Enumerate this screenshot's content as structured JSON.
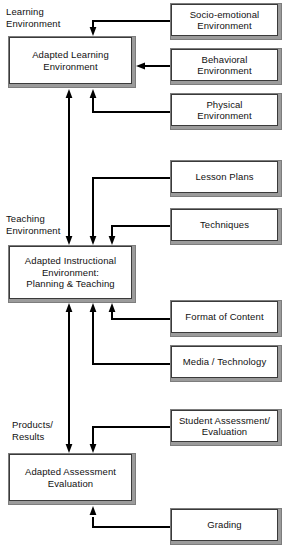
{
  "diagram": {
    "canvas": {
      "width": 286,
      "height": 557,
      "background": "#ffffff"
    },
    "style": {
      "box_face": "#ffffff",
      "box_shadow": "#9b9b9b",
      "line": "#000000",
      "text": "#111111"
    },
    "captions": [
      {
        "id": "cap-learning",
        "text": "Learning\nEnvironment",
        "x": 6,
        "y": 6
      },
      {
        "id": "cap-teaching",
        "text": "Teaching\nEnvironment",
        "x": 6,
        "y": 213
      },
      {
        "id": "cap-products",
        "text": "Products/\nResults",
        "x": 12,
        "y": 419
      }
    ],
    "nodes": [
      {
        "id": "adapted-learning-environment",
        "text": "Adapted Learning\nEnvironment",
        "x": 8,
        "y": 36,
        "w": 128,
        "h": 52,
        "side": "left"
      },
      {
        "id": "socio-emotional-environment",
        "text": "Socio-emotional\nEnvironment",
        "x": 170,
        "y": 3,
        "w": 112,
        "h": 37,
        "side": "right"
      },
      {
        "id": "behavioral-environment",
        "text": "Behavioral\nEnvironment",
        "x": 170,
        "y": 48,
        "w": 112,
        "h": 37,
        "side": "right"
      },
      {
        "id": "physical-environment",
        "text": "Physical\nEnvironment",
        "x": 170,
        "y": 93,
        "w": 112,
        "h": 37,
        "side": "right"
      },
      {
        "id": "lesson-plans",
        "text": "Lesson Plans",
        "x": 170,
        "y": 160,
        "w": 112,
        "h": 37,
        "side": "right"
      },
      {
        "id": "techniques",
        "text": "Techniques",
        "x": 170,
        "y": 208,
        "w": 112,
        "h": 37,
        "side": "right"
      },
      {
        "id": "adapted-instructional-environment",
        "text": "Adapted Instructional\nEnvironment:\nPlanning & Teaching",
        "x": 8,
        "y": 245,
        "w": 128,
        "h": 58,
        "side": "left"
      },
      {
        "id": "format-of-content",
        "text": "Format of Content",
        "x": 170,
        "y": 300,
        "w": 112,
        "h": 37,
        "side": "right"
      },
      {
        "id": "media-technology",
        "text": "Media / Technology",
        "x": 170,
        "y": 345,
        "w": 112,
        "h": 37,
        "side": "right"
      },
      {
        "id": "student-assessment-evaluation",
        "text": "Student Assessment/\nEvaluation",
        "x": 170,
        "y": 409,
        "w": 112,
        "h": 37,
        "side": "right"
      },
      {
        "id": "adapted-assessment-evaluation",
        "text": "Adapted Assessment\nEvaluation",
        "x": 8,
        "y": 453,
        "w": 128,
        "h": 52,
        "side": "left"
      },
      {
        "id": "grading",
        "text": "Grading",
        "x": 170,
        "y": 508,
        "w": 112,
        "h": 37,
        "side": "right"
      }
    ],
    "edges": [
      {
        "id": "edge-socio-to-learning",
        "from": "socio-emotional-environment",
        "to": "adapted-learning-environment",
        "path": "M170,21 L93,21 L93,32",
        "arrow": "down",
        "tip": [
          93,
          34
        ]
      },
      {
        "id": "edge-behavioral-to-learning",
        "from": "behavioral-environment",
        "to": "adapted-learning-environment",
        "path": "M170,66 L142,66",
        "arrow": "left",
        "tip": [
          137,
          66
        ]
      },
      {
        "id": "edge-physical-to-learning",
        "from": "physical-environment",
        "to": "adapted-learning-environment",
        "path": "M170,111 L93,111 L93,97",
        "arrow": "up",
        "tip": [
          93,
          91
        ]
      },
      {
        "id": "edge-instructional-to-learning",
        "from": "adapted-instructional-environment",
        "to": "adapted-learning-environment",
        "path": "M69,241 L69,97",
        "arrow": "up",
        "tip": [
          69,
          91
        ]
      },
      {
        "id": "edge-lesson-plans-to-instructional",
        "from": "lesson-plans",
        "to": "adapted-instructional-environment",
        "path": "M170,178 L93,178 L93,235",
        "arrow": "down",
        "tip": [
          93,
          242
        ]
      },
      {
        "id": "edge-techniques-to-instructional",
        "from": "techniques",
        "to": "adapted-instructional-environment",
        "path": "M170,226 L112,226 L112,235",
        "arrow": "down",
        "tip": [
          112,
          242
        ]
      },
      {
        "id": "edge-format-to-instructional",
        "from": "format-of-content",
        "to": "adapted-instructional-environment",
        "path": "M170,318 L112,318 L112,313",
        "arrow": "up",
        "tip": [
          112,
          306
        ]
      },
      {
        "id": "edge-media-to-instructional",
        "from": "media-technology",
        "to": "adapted-instructional-environment",
        "path": "M170,363 L93,363 L93,313",
        "arrow": "up",
        "tip": [
          93,
          306
        ]
      },
      {
        "id": "edge-assessment-to-instructional",
        "from": "adapted-assessment-evaluation",
        "to": "adapted-instructional-environment",
        "path": "M69,449 L69,313",
        "arrow": "up",
        "tip": [
          69,
          306
        ]
      },
      {
        "id": "edge-student-assessment-to-assessment",
        "from": "student-assessment-evaluation",
        "to": "adapted-assessment-evaluation",
        "path": "M170,427 L93,427 L93,443",
        "arrow": "down",
        "tip": [
          93,
          450
        ]
      },
      {
        "id": "edge-grading-to-assessment",
        "from": "grading",
        "to": "adapted-assessment-evaluation",
        "path": "M170,526 L93,526 L93,518",
        "arrow": "up",
        "tip": [
          93,
          511
        ]
      },
      {
        "id": "edge-learning-to-instructional-down",
        "from": "adapted-learning-environment",
        "to": "adapted-instructional-environment",
        "path": "M69,92 L69,236",
        "arrow": "down",
        "tip": [
          69,
          242
        ]
      }
    ]
  }
}
